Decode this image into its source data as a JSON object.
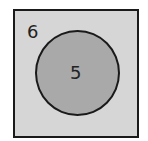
{
  "diagram": {
    "type": "venn",
    "universe": {
      "label": "6",
      "fill": "#d6d6d6"
    },
    "sets": [
      {
        "label": "5",
        "fill": "#a9a9a9"
      }
    ]
  }
}
